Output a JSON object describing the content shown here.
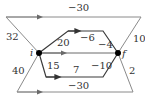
{
  "diagram": {
    "nodes": {
      "i": {
        "label": "i",
        "x": 39,
        "y": 53
      },
      "f": {
        "label": "f",
        "x": 118,
        "y": 53
      }
    },
    "edges": {
      "top": {
        "label": "−30"
      },
      "top_left": {
        "label": "32"
      },
      "top_right": {
        "label": "10"
      },
      "upper_rise": {
        "label": "20"
      },
      "upper_flat": {
        "label": "−6"
      },
      "upper_fall": {
        "label": "−4"
      },
      "middle": {
        "label": ""
      },
      "lower_drop": {
        "label": "15"
      },
      "lower_flat": {
        "label": "7"
      },
      "lower_rise": {
        "label": "−10"
      },
      "bottom_left": {
        "label": "40"
      },
      "bottom_right": {
        "label": "2"
      },
      "bottom": {
        "label": "−30"
      }
    },
    "colors": {
      "outer": "#8a8a8a",
      "inner": "#3a3a3a",
      "node": "#000000"
    }
  }
}
